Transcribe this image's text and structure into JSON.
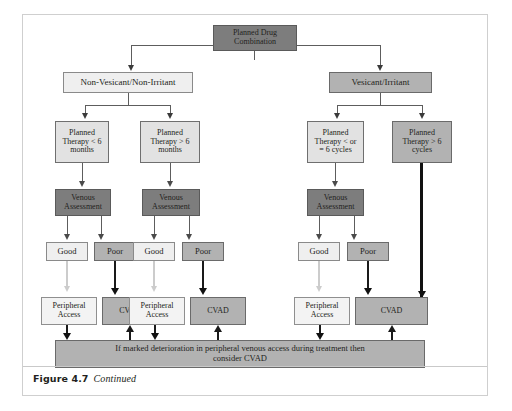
{
  "figure": {
    "label": "Figure 4.7",
    "text": "Continued"
  },
  "colors": {
    "fill_dark": "#7d7d7d",
    "fill_mid": "#b2b2b2",
    "fill_light": "#e2e2e2",
    "fill_pale": "#efefef",
    "border": "#6f6f6f",
    "arrow_dark": "#111111",
    "arrow_pale": "#cccccc",
    "frame": "#cfcfcf"
  },
  "diagram": {
    "type": "flowchart",
    "root": {
      "label": "Planned Drug Combination",
      "shade": "dark"
    },
    "branches": [
      {
        "label": "Non-Vesicant/Non-Irritant",
        "shade": "pale",
        "therapies": [
          {
            "label": "Planned Therapy < 6 months",
            "shade": "light",
            "assessment": {
              "label": "Venous Assessment",
              "shade": "dark"
            },
            "outcomes": [
              {
                "label": "Good",
                "shade": "pale",
                "access": {
                  "label": "Peripheral Access",
                  "shade": "vlight"
                }
              },
              {
                "label": "Poor",
                "shade": "mid",
                "access": {
                  "label": "CVAD",
                  "shade": "mid"
                }
              }
            ]
          },
          {
            "label": "Planned Therapy > 6 months",
            "shade": "light",
            "assessment": {
              "label": "Venous Assessment",
              "shade": "dark"
            },
            "outcomes": [
              {
                "label": "Good",
                "shade": "pale",
                "access": {
                  "label": "Peripheral Access",
                  "shade": "vlight"
                }
              },
              {
                "label": "Poor",
                "shade": "mid",
                "access": {
                  "label": "CVAD",
                  "shade": "mid"
                }
              }
            ]
          }
        ]
      },
      {
        "label": "Vesicant/Irritant",
        "shade": "mid",
        "therapies": [
          {
            "label": "Planned Therapy < or = 6 cycles",
            "shade": "light",
            "assessment": {
              "label": "Venous Assessment",
              "shade": "dark"
            },
            "outcomes": [
              {
                "label": "Good",
                "shade": "pale",
                "access": {
                  "label": "Peripheral Access",
                  "shade": "vlight"
                }
              },
              {
                "label": "Poor",
                "shade": "mid",
                "access": {
                  "label": "CVAD",
                  "shade": "mid"
                }
              }
            ]
          },
          {
            "label": "Planned Therapy > 6 cycles",
            "shade": "mid",
            "assessment": null,
            "outcomes": [
              {
                "label": "",
                "shade": "none",
                "access": {
                  "label": "CVAD",
                  "shade": "mid"
                }
              }
            ]
          }
        ]
      }
    ],
    "banner": {
      "line1": "If marked deterioration in peripheral venous access during treatment then",
      "line2": "consider CVAD",
      "shade": "mid"
    },
    "nodes": {
      "root": "Planned Drug Combination",
      "branch_left": "Non-Vesicant/Non-Irritant",
      "branch_right": "Vesicant/Irritant",
      "therapy_1": {
        "l1": "Planned",
        "l2": "Therapy < 6",
        "l3": "months"
      },
      "therapy_2": {
        "l1": "Planned",
        "l2": "Therapy > 6",
        "l3": "months"
      },
      "therapy_3": {
        "l1": "Planned",
        "l2": "Therapy < or",
        "l3": "= 6 cycles"
      },
      "therapy_4": {
        "l1": "Planned",
        "l2": "Therapy > 6",
        "l3": "cycles"
      },
      "venous_1": {
        "l1": "Venous",
        "l2": "Assessment"
      },
      "venous_2": {
        "l1": "Venous",
        "l2": "Assessment"
      },
      "venous_3": {
        "l1": "Venous",
        "l2": "Assessment"
      },
      "good_1": "Good",
      "poor_1": "Poor",
      "good_2": "Good",
      "poor_2": "Poor",
      "good_3": "Good",
      "poor_3": "Poor",
      "periph_1": {
        "l1": "Peripheral",
        "l2": "Access"
      },
      "cvad_1": "CVAD",
      "periph_2": {
        "l1": "Peripheral",
        "l2": "Access"
      },
      "cvad_2": "CVAD",
      "periph_3": {
        "l1": "Peripheral",
        "l2": "Access"
      },
      "cvad_3": "CVAD",
      "banner_l1": "If marked deterioration in peripheral venous access during treatment then",
      "banner_l2": "consider CVAD"
    }
  }
}
